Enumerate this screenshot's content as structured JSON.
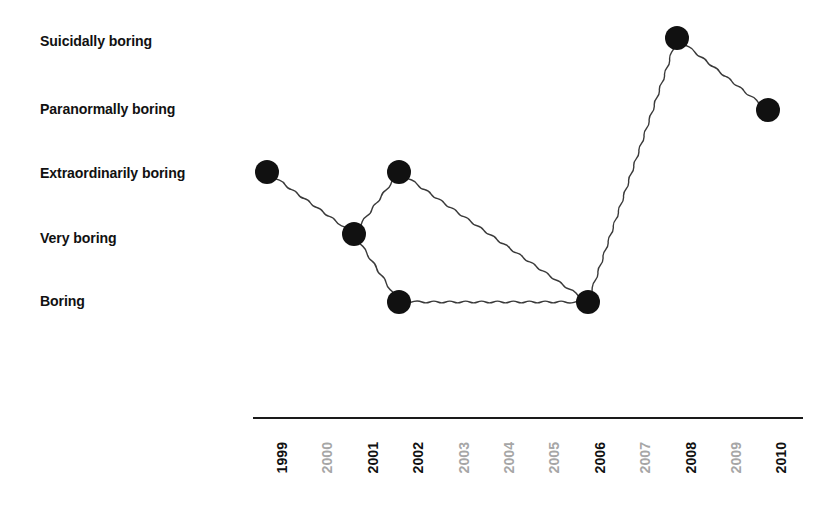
{
  "chart_data": {
    "type": "line",
    "title": "",
    "subtitle": "",
    "xlabel": "",
    "ylabel": "",
    "grid": false,
    "legend": "none",
    "y_categories": [
      "Boring",
      "Very boring",
      "Extraordinarily boring",
      "Paranormally boring",
      "Suicidally boring"
    ],
    "y_levels": [
      1,
      2,
      3,
      4,
      5
    ],
    "x_ticks": [
      {
        "label": "1999",
        "has_data": true
      },
      {
        "label": "2000",
        "has_data": false
      },
      {
        "label": "2001",
        "has_data": true
      },
      {
        "label": "2002",
        "has_data": true
      },
      {
        "label": "2003",
        "has_data": false
      },
      {
        "label": "2004",
        "has_data": false
      },
      {
        "label": "2005",
        "has_data": false
      },
      {
        "label": "2006",
        "has_data": true
      },
      {
        "label": "2007",
        "has_data": false
      },
      {
        "label": "2008",
        "has_data": true
      },
      {
        "label": "2009",
        "has_data": false
      },
      {
        "label": "2010",
        "has_data": true
      }
    ],
    "xlim": [
      "1999",
      "2010"
    ],
    "ylim": [
      "Boring",
      "Suicidally boring"
    ],
    "points": [
      {
        "x": "1999",
        "y": "Extraordinarily boring",
        "y_level": 3,
        "px": 267,
        "py": 172
      },
      {
        "x": "2001",
        "y": "Very boring",
        "y_level": 2,
        "px": 354,
        "py": 234
      },
      {
        "x": "2002",
        "y": "Extraordinarily boring",
        "y_level": 3,
        "px": 399,
        "py": 172
      },
      {
        "x": "2002",
        "y": "Boring",
        "y_level": 1,
        "px": 399,
        "py": 302
      },
      {
        "x": "2006",
        "y": "Boring",
        "y_level": 1,
        "px": 588,
        "py": 302
      },
      {
        "x": "2008",
        "y": "Suicidally boring",
        "y_level": 5,
        "px": 677,
        "py": 38
      },
      {
        "x": "2010",
        "y": "Paranormally boring",
        "y_level": 4,
        "px": 768,
        "py": 110
      }
    ],
    "segments": [
      {
        "from": 0,
        "to": 1,
        "name": "1999-2001"
      },
      {
        "from": 1,
        "to": 2,
        "name": "2001-2002-upper"
      },
      {
        "from": 2,
        "to": 4,
        "name": "2002-upper-2006"
      },
      {
        "from": 1,
        "to": 3,
        "name": "2001-2002-lower"
      },
      {
        "from": 3,
        "to": 4,
        "name": "2002-lower-2006"
      },
      {
        "from": 4,
        "to": 5,
        "name": "2006-2008"
      },
      {
        "from": 5,
        "to": 6,
        "name": "2008-2010"
      }
    ],
    "style": {
      "marker_color": "#111111",
      "marker_radius": 12,
      "line_color": "#3a3a3a",
      "line_style": "wavy-hand-drawn",
      "axis_color": "#1a1a1a",
      "inactive_tick_color": "#a6a6a6",
      "background": "#ffffff"
    },
    "axis_line": {
      "x1": 253,
      "x2": 803,
      "y": 418
    },
    "y_pixel_map": {
      "Boring": 300,
      "Very boring": 237,
      "Extraordinarily boring": 172,
      "Paranormally boring": 108,
      "Suicidally boring": 40
    },
    "x_pixel_start": 267,
    "x_pixel_step": 45.4
  }
}
